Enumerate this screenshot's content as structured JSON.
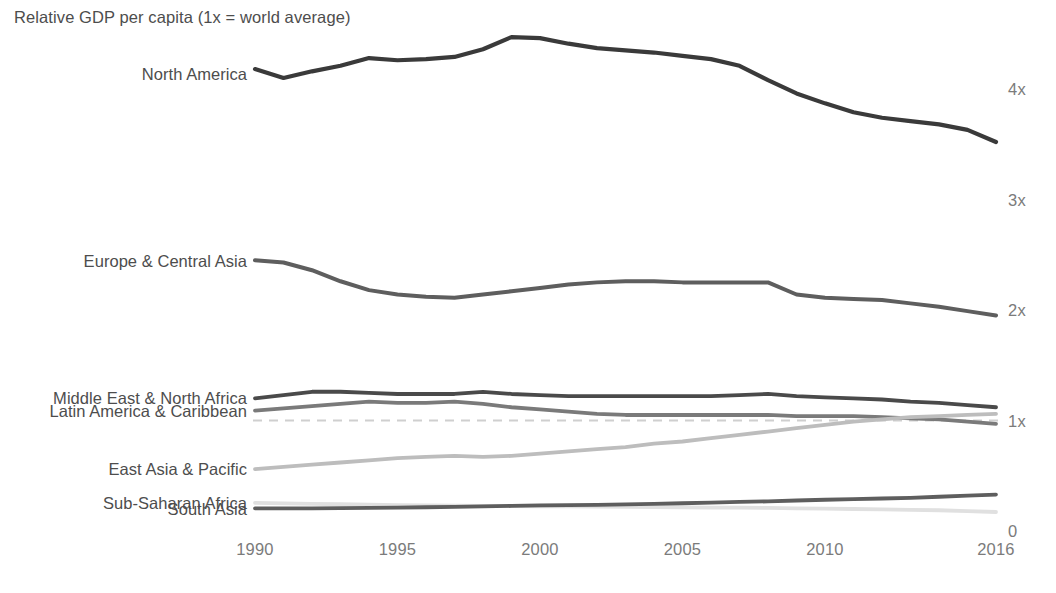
{
  "chart_data": {
    "type": "line",
    "title": "Relative GDP per capita (1x = world average)",
    "xlabel": "",
    "ylabel": "",
    "x": [
      1990,
      1991,
      1992,
      1993,
      1994,
      1995,
      1996,
      1997,
      1998,
      1999,
      2000,
      2001,
      2002,
      2003,
      2004,
      2005,
      2006,
      2007,
      2008,
      2009,
      2010,
      2011,
      2012,
      2013,
      2014,
      2015,
      2016
    ],
    "xticks": [
      "1990",
      "1995",
      "2000",
      "2005",
      "2010",
      "2016"
    ],
    "xtick_values": [
      1990,
      1995,
      2000,
      2005,
      2010,
      2016
    ],
    "yticks": [
      "0",
      "1x",
      "2x",
      "3x",
      "4x"
    ],
    "ytick_values": [
      0,
      1,
      2,
      3,
      4
    ],
    "ylim": [
      0,
      4.6
    ],
    "xlim": [
      1990,
      2016
    ],
    "grid": false,
    "legend_position": "inline-left-labels",
    "reference_line": {
      "value": 1,
      "style": "dashed",
      "color": "#cfcfcf",
      "label": "1x = world average"
    },
    "series": [
      {
        "name": "North America",
        "color": "#3a3a3a",
        "width": 4.2,
        "values": [
          4.18,
          4.1,
          4.16,
          4.21,
          4.28,
          4.26,
          4.27,
          4.29,
          4.36,
          4.47,
          4.46,
          4.41,
          4.37,
          4.35,
          4.33,
          4.3,
          4.27,
          4.21,
          4.08,
          3.96,
          3.87,
          3.79,
          3.74,
          3.71,
          3.68,
          3.63,
          3.52
        ]
      },
      {
        "name": "Europe & Central Asia",
        "color": "#5e5e5e",
        "width": 4.0,
        "values": [
          2.45,
          2.43,
          2.36,
          2.26,
          2.18,
          2.14,
          2.12,
          2.11,
          2.14,
          2.17,
          2.2,
          2.23,
          2.25,
          2.26,
          2.26,
          2.25,
          2.25,
          2.25,
          2.25,
          2.14,
          2.11,
          2.1,
          2.09,
          2.06,
          2.03,
          1.99,
          1.95
        ]
      },
      {
        "name": "Middle East & North Africa",
        "color": "#4a4a4a",
        "width": 3.8,
        "values": [
          1.2,
          1.23,
          1.26,
          1.26,
          1.25,
          1.24,
          1.24,
          1.24,
          1.26,
          1.24,
          1.23,
          1.22,
          1.22,
          1.22,
          1.22,
          1.22,
          1.22,
          1.23,
          1.24,
          1.22,
          1.21,
          1.2,
          1.19,
          1.17,
          1.16,
          1.14,
          1.12
        ]
      },
      {
        "name": "Latin America & Caribbean",
        "color": "#7a7a7a",
        "width": 3.8,
        "values": [
          1.09,
          1.11,
          1.13,
          1.15,
          1.17,
          1.16,
          1.16,
          1.17,
          1.15,
          1.12,
          1.1,
          1.08,
          1.06,
          1.05,
          1.05,
          1.05,
          1.05,
          1.05,
          1.05,
          1.04,
          1.04,
          1.04,
          1.03,
          1.02,
          1.01,
          0.99,
          0.97
        ]
      },
      {
        "name": "East Asia & Pacific",
        "color": "#bdbdbd",
        "width": 3.8,
        "values": [
          0.56,
          0.58,
          0.6,
          0.62,
          0.64,
          0.66,
          0.67,
          0.68,
          0.67,
          0.68,
          0.7,
          0.72,
          0.74,
          0.76,
          0.79,
          0.81,
          0.84,
          0.87,
          0.9,
          0.93,
          0.96,
          0.99,
          1.01,
          1.03,
          1.04,
          1.05,
          1.06
        ]
      },
      {
        "name": "Sub-Saharan Africa",
        "color": "#e0e0e0",
        "width": 3.8,
        "values": [
          0.255,
          0.25,
          0.246,
          0.242,
          0.238,
          0.234,
          0.232,
          0.23,
          0.228,
          0.226,
          0.224,
          0.222,
          0.22,
          0.218,
          0.216,
          0.214,
          0.212,
          0.211,
          0.209,
          0.205,
          0.202,
          0.199,
          0.196,
          0.192,
          0.188,
          0.18,
          0.172
        ]
      },
      {
        "name": "South Asia",
        "color": "#5e5e5e",
        "width": 3.8,
        "values": [
          0.205,
          0.204,
          0.205,
          0.207,
          0.209,
          0.212,
          0.215,
          0.218,
          0.222,
          0.227,
          0.231,
          0.234,
          0.237,
          0.241,
          0.246,
          0.251,
          0.257,
          0.263,
          0.268,
          0.276,
          0.283,
          0.289,
          0.294,
          0.3,
          0.31,
          0.32,
          0.33
        ]
      }
    ],
    "series_label_anchors": [
      {
        "name": "North America",
        "label_y_value": 4.14
      },
      {
        "name": "Europe & Central Asia",
        "label_y_value": 2.44
      },
      {
        "name": "Middle East & North Africa",
        "label_y_value": 1.2
      },
      {
        "name": "Latin America & Caribbean",
        "label_y_value": 1.09
      },
      {
        "name": "East Asia & Pacific",
        "label_y_value": 0.56
      },
      {
        "name": "Sub-Saharan Africa",
        "label_y_value": 0.255
      },
      {
        "name": "South Asia",
        "label_y_value": 0.195
      }
    ]
  }
}
